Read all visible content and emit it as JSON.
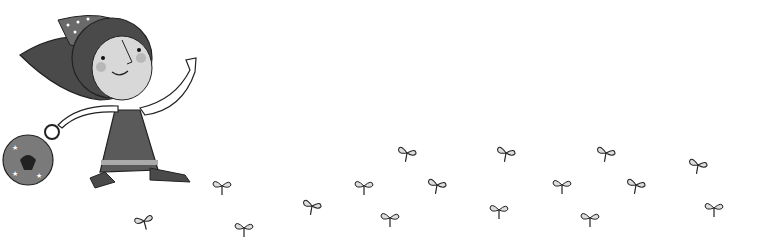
{
  "illustration": {
    "subject": "girl-running-with-bag",
    "colors": {
      "background": "#ffffff",
      "hair": "#4a4a4a",
      "face": "#d8d8d8",
      "dress": "#5a5a5a",
      "leaf": "#dddddd",
      "outline": "#222222"
    }
  },
  "sprouts": [
    {
      "x": 210,
      "y": 176,
      "r": 0
    },
    {
      "x": 132,
      "y": 211,
      "r": -15
    },
    {
      "x": 232,
      "y": 218,
      "r": 0
    },
    {
      "x": 300,
      "y": 196,
      "r": 10
    },
    {
      "x": 352,
      "y": 176,
      "r": 0
    },
    {
      "x": 395,
      "y": 143,
      "r": 10
    },
    {
      "x": 378,
      "y": 208,
      "r": 0
    },
    {
      "x": 425,
      "y": 175,
      "r": 10
    },
    {
      "x": 487,
      "y": 200,
      "r": 0
    },
    {
      "x": 494,
      "y": 143,
      "r": 10
    },
    {
      "x": 550,
      "y": 175,
      "r": 0
    },
    {
      "x": 578,
      "y": 208,
      "r": 0
    },
    {
      "x": 594,
      "y": 143,
      "r": 10
    },
    {
      "x": 624,
      "y": 175,
      "r": 10
    },
    {
      "x": 686,
      "y": 155,
      "r": 10
    },
    {
      "x": 702,
      "y": 198,
      "r": 0
    }
  ]
}
